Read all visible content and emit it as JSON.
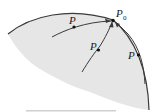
{
  "diagram": {
    "colors": {
      "region_fill": "#e6e6e6",
      "stroke": "#3a3a3a",
      "point": "#111111",
      "footer_line": "#cfcfcf"
    },
    "boundary_point": {
      "label": "P",
      "subscript": "0"
    },
    "paths": [
      {
        "id": "path-1",
        "point_label": "P"
      },
      {
        "id": "path-2",
        "point_label": "P"
      },
      {
        "id": "path-3",
        "point_label": "P"
      }
    ]
  }
}
